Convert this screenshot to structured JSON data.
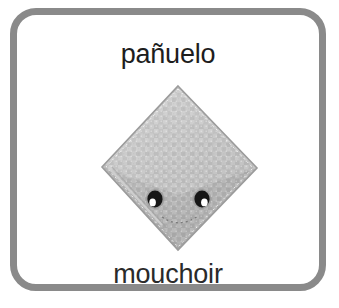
{
  "card": {
    "border_color": "#8a8a8a",
    "background_color": "#ffffff",
    "spanish_label": "pañuelo",
    "french_label": "mouchoir"
  },
  "illustration": {
    "name": "handkerchief-diamond",
    "alt_text": "pañuelo",
    "fabric_color": "#b8b8b8",
    "fabric_highlight_color": "#cacaca",
    "fabric_shadow_color": "#a6a6a6",
    "outline_color": "#9a9a9a",
    "eye_color": "#1a1a1a",
    "eye_highlight_color": "#ffffff",
    "eyes": [
      {
        "name": "eye-left",
        "cx": 55,
        "cy": 124
      },
      {
        "name": "eye-right",
        "cx": 102,
        "cy": 124
      }
    ],
    "vertices": {
      "top": [
        78,
        11
      ],
      "right": [
        157,
        93
      ],
      "bottom": [
        78,
        175
      ],
      "left": [
        2,
        92
      ]
    }
  }
}
